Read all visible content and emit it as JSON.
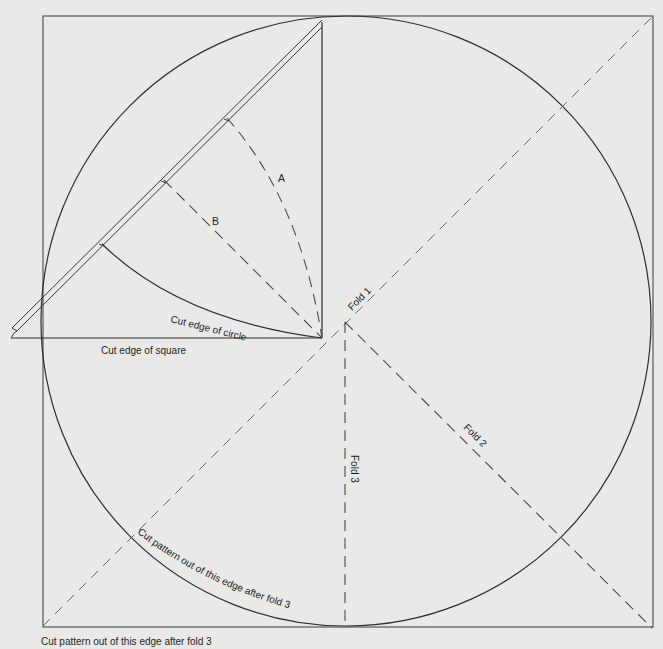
{
  "diagram": {
    "colors": {
      "background": "#e9e9e8",
      "line": "#3a3a3a"
    },
    "labels": {
      "fold1": "Fold 1",
      "fold2": "Fold 2",
      "fold3": "Fold 3",
      "arc_a": "A",
      "line_b": "B",
      "cut_edge_circle": "Cut edge of circle",
      "cut_edge_square": "Cut edge of square",
      "cut_pattern_curved": "Cut pattern out of this edge after fold 3",
      "cut_pattern_caption": "Cut pattern out of this edge  after fold 3"
    },
    "shapes": {
      "outer_square": "square sheet",
      "circle": "circle inscribed in square",
      "folded_triangle": "folded wedge detail (inset)"
    }
  }
}
